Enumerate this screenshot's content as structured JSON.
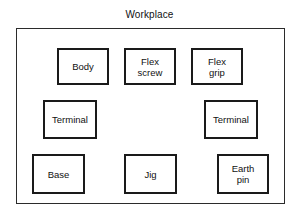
{
  "diagram": {
    "type": "layout-diagram",
    "title": "Workplace",
    "frame_label": "Workplace",
    "colors": {
      "background": "#ffffff",
      "frame_border": "#2b2b2b",
      "box_border": "#1a1a1a",
      "box_fill": "#ffffff",
      "text": "#111111"
    },
    "boxes": [
      {
        "label": "Body",
        "row": 1,
        "column": 1,
        "x": 56,
        "y": 47,
        "width": 52,
        "height": 37
      },
      {
        "label": "Flex\nscrew",
        "row": 1,
        "column": 2,
        "x": 123,
        "y": 47,
        "width": 52,
        "height": 37
      },
      {
        "label": "Flex\ngrip",
        "row": 1,
        "column": 3,
        "x": 190,
        "y": 47,
        "width": 52,
        "height": 37
      },
      {
        "label": "Terminal",
        "row": 2,
        "column": 1,
        "x": 42,
        "y": 99,
        "width": 54,
        "height": 39
      },
      {
        "label": "Terminal",
        "row": 2,
        "column": 3,
        "x": 203,
        "y": 99,
        "width": 54,
        "height": 39
      },
      {
        "label": "Base",
        "row": 3,
        "column": 1,
        "x": 31,
        "y": 153,
        "width": 53,
        "height": 40
      },
      {
        "label": "Jig",
        "row": 3,
        "column": 2,
        "x": 123,
        "y": 153,
        "width": 53,
        "height": 40
      },
      {
        "label": "Earth\npin",
        "row": 3,
        "column": 3,
        "x": 216,
        "y": 153,
        "width": 52,
        "height": 40
      }
    ]
  }
}
